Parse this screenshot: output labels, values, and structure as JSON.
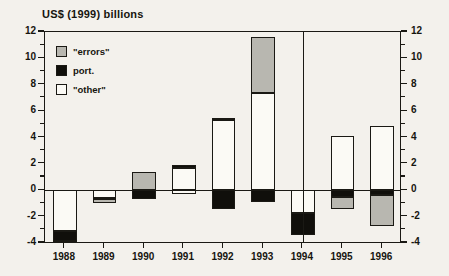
{
  "chart_data": {
    "type": "bar",
    "title": "US$ (1999) billions",
    "subtitle": "",
    "xlabel": "",
    "ylabel": "US$ (1999) billions",
    "categories": [
      "1988",
      "1989",
      "1990",
      "1991",
      "1992",
      "1993",
      "1994",
      "1995",
      "1996"
    ],
    "ylim": [
      -4,
      12
    ],
    "ytick_values": [
      -4,
      -2,
      0,
      2,
      4,
      6,
      8,
      10,
      12
    ],
    "ytick_labels": [
      "-4",
      "-2",
      "0",
      "2",
      "4",
      "6",
      "8",
      "10",
      "12"
    ],
    "minor_tick_step": 1,
    "grid": false,
    "stacked": true,
    "dual_axis": true,
    "legend_position": "top-left",
    "annotations": [
      {
        "type": "vertical-line",
        "at": "1994",
        "note": "vertical divider at 1994"
      }
    ],
    "series": [
      {
        "name": "\"errors\"",
        "color": "#b8b7b0",
        "values": [
          -0.15,
          -0.3,
          1.35,
          0.0,
          0.15,
          4.2,
          0.0,
          -0.95,
          -2.35
        ]
      },
      {
        "name": "port.",
        "color": "#100f0b",
        "values": [
          -0.75,
          -0.15,
          -0.65,
          0.25,
          -1.4,
          -0.9,
          0.0,
          -0.5,
          -0.35
        ]
      },
      {
        "name": "\"other\"",
        "color": "#fbfaf5",
        "values": [
          -3.1,
          -0.55,
          0.0,
          1.65,
          5.35,
          7.4,
          -1.75,
          4.1,
          4.85
        ]
      }
    ],
    "bars": [
      {
        "category": "1988",
        "positive_stack": [],
        "negative_stack": [
          {
            "series": "\"other\"",
            "from": 0.0,
            "to": -3.1
          },
          {
            "series": "port.",
            "from": -3.1,
            "to": -3.85
          },
          {
            "series": "\"errors\"",
            "from": -3.85,
            "to": -4.0
          }
        ]
      },
      {
        "category": "1989",
        "positive_stack": [],
        "negative_stack": [
          {
            "series": "\"other\"",
            "from": 0.0,
            "to": -0.55
          },
          {
            "series": "port.",
            "from": -0.55,
            "to": -0.7
          },
          {
            "series": "\"errors\"",
            "from": -0.7,
            "to": -1.0
          }
        ]
      },
      {
        "category": "1990",
        "positive_stack": [
          {
            "series": "\"errors\"",
            "from": 0.0,
            "to": 1.35
          }
        ],
        "negative_stack": [
          {
            "series": "port.",
            "from": 0.0,
            "to": -0.65
          }
        ]
      },
      {
        "category": "1991",
        "positive_stack": [
          {
            "series": "\"other\"",
            "from": 0.0,
            "to": 1.65
          },
          {
            "series": "port.",
            "from": 1.65,
            "to": 1.9
          }
        ],
        "negative_stack": [
          {
            "series": "\"other\"",
            "from": 0.0,
            "to": -0.25
          }
        ]
      },
      {
        "category": "1992",
        "positive_stack": [
          {
            "series": "\"other\"",
            "from": 0.0,
            "to": 5.35
          },
          {
            "series": "\"errors\"",
            "from": 5.35,
            "to": 5.5
          }
        ],
        "negative_stack": [
          {
            "series": "port.",
            "from": 0.0,
            "to": -1.4
          }
        ]
      },
      {
        "category": "1993",
        "positive_stack": [
          {
            "series": "\"other\"",
            "from": 0.0,
            "to": 7.4
          },
          {
            "series": "\"errors\"",
            "from": 7.4,
            "to": 11.6
          }
        ],
        "negative_stack": [
          {
            "series": "port.",
            "from": 0.0,
            "to": -0.9
          }
        ]
      },
      {
        "category": "1994",
        "positive_stack": [],
        "negative_stack": [
          {
            "series": "\"other\"",
            "from": 0.0,
            "to": -1.75
          },
          {
            "series": "port.",
            "from": -1.75,
            "to": -3.4
          }
        ]
      },
      {
        "category": "1995",
        "positive_stack": [
          {
            "series": "\"other\"",
            "from": 0.0,
            "to": 4.1
          }
        ],
        "negative_stack": [
          {
            "series": "port.",
            "from": 0.0,
            "to": -0.5
          },
          {
            "series": "\"errors\"",
            "from": -0.5,
            "to": -1.45
          }
        ]
      },
      {
        "category": "1996",
        "positive_stack": [
          {
            "series": "\"other\"",
            "from": 0.0,
            "to": 4.85
          }
        ],
        "negative_stack": [
          {
            "series": "port.",
            "from": 0.0,
            "to": -0.35
          },
          {
            "series": "\"errors\"",
            "from": -0.35,
            "to": -2.7
          }
        ]
      }
    ],
    "legend": [
      {
        "label": "\"errors\"",
        "color": "#b8b7b0"
      },
      {
        "label": "port.",
        "color": "#100f0b"
      },
      {
        "label": "\"other\"",
        "color": "#fbfaf5"
      }
    ]
  }
}
